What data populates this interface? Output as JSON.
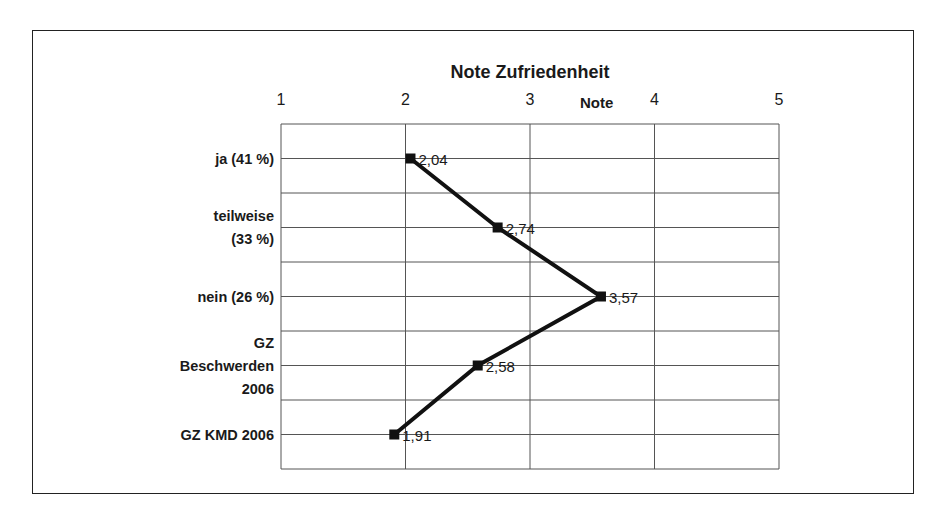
{
  "chart_data": {
    "type": "line",
    "orientation": "horizontal-value-axis",
    "title": "Note Zufriedenheit",
    "xlabel": "Note",
    "ylabel": "",
    "xlim": [
      1,
      5
    ],
    "x_ticks": [
      "1",
      "2",
      "3",
      "4",
      "5"
    ],
    "grid": true,
    "legend": null,
    "categories": [
      [
        "ja (41 %)"
      ],
      [
        "teilweise",
        "(33 %)"
      ],
      [
        "nein (26 %)"
      ],
      [
        "GZ",
        "Beschwerden",
        "2006"
      ],
      [
        "GZ KMD 2006"
      ]
    ],
    "series": [
      {
        "name": "Note",
        "values": [
          2.04,
          2.74,
          3.57,
          2.58,
          1.91
        ],
        "labels": [
          "2,04",
          "2,74",
          "3,57",
          "2,58",
          "1,91"
        ],
        "color": "#111111",
        "marker": "square"
      }
    ]
  },
  "colors": {
    "line": "#111111",
    "grid": "#555555",
    "frame": "#222222"
  }
}
